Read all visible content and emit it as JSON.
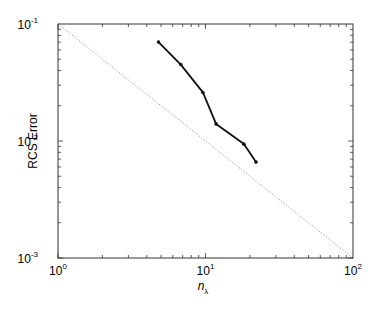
{
  "chart_data": {
    "type": "line",
    "title": "",
    "xlabel": "n_λ",
    "xlabel_base": "n",
    "xlabel_sub": "λ",
    "ylabel": "RCS Error",
    "xscale": "log",
    "yscale": "log",
    "xlim": [
      1,
      100
    ],
    "ylim": [
      0.001,
      0.1
    ],
    "grid": false,
    "legend": null,
    "x_ticks": [
      {
        "value": 1,
        "base": "10",
        "exp": "0"
      },
      {
        "value": 10,
        "base": "10",
        "exp": "1"
      },
      {
        "value": 100,
        "base": "10",
        "exp": "2"
      }
    ],
    "y_ticks": [
      {
        "value": 0.001,
        "base": "10",
        "exp": "-3"
      },
      {
        "value": 0.01,
        "base": "10",
        "exp": "-2"
      },
      {
        "value": 0.1,
        "base": "10",
        "exp": "-1"
      }
    ],
    "series": [
      {
        "name": "RCS error",
        "style": "solid-with-markers",
        "color": "#111111",
        "x": [
          4.8,
          6.8,
          9.6,
          11.8,
          18.2,
          22
        ],
        "y": [
          0.07,
          0.045,
          0.026,
          0.014,
          0.0094,
          0.0066
        ]
      },
      {
        "name": "reference slope -1",
        "style": "dotted",
        "color": "#9a9a9a",
        "x": [
          1,
          100
        ],
        "y": [
          0.1,
          0.001
        ]
      }
    ]
  }
}
